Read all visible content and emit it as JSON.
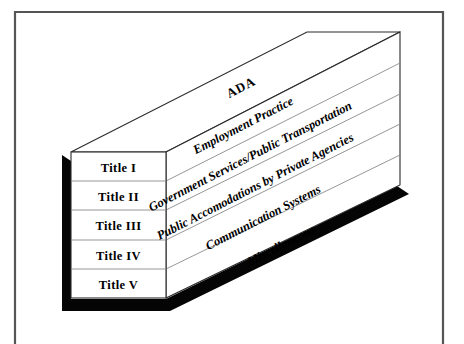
{
  "figure": {
    "name": "ADA Titles 3D Block Diagram",
    "heading_label": "ADA",
    "front_rows": [
      {
        "label": "Title I"
      },
      {
        "label": "Title II"
      },
      {
        "label": "Title III"
      },
      {
        "label": "Title IV"
      },
      {
        "label": "Title V"
      }
    ],
    "side_labels": [
      {
        "text": "Employment Practice",
        "font_size": 12.5
      },
      {
        "text": "Government Services/Public Transportation",
        "font_size": 12.5
      },
      {
        "text": "Public Accomodations by Private Agencies",
        "font_size": 12.5
      },
      {
        "text": "Communication Systems",
        "font_size": 12.5
      },
      {
        "text": "Miscellaneous",
        "font_size": 12.5
      }
    ],
    "colors": {
      "background": "#ffffff",
      "face": "#ffffff",
      "edge": "#2b2b2b",
      "slab_line": "#8a8a8a",
      "shadow": "#050505",
      "frame": "#555555",
      "text": "#000000"
    }
  }
}
